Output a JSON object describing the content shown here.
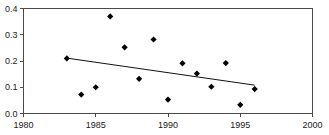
{
  "figure": {
    "top_artifact_text": "· · ·"
  },
  "chart_data": {
    "type": "scatter",
    "title": "",
    "subtitle": "",
    "xlabel": "",
    "ylabel": "",
    "xlim": [
      1980,
      2000
    ],
    "ylim": [
      0.0,
      0.4
    ],
    "xticks": [
      1980,
      1985,
      1990,
      1995,
      2000
    ],
    "xticklabels": [
      "1980",
      "1985",
      "1990",
      "1995",
      "2000"
    ],
    "yticks": [
      0.0,
      0.1,
      0.2,
      0.3,
      0.4
    ],
    "yticklabels": [
      "0.0",
      "0.1",
      "0.2",
      "0.3",
      "0.4"
    ],
    "grid": false,
    "legend": false,
    "marker": "diamond",
    "marker_color": "#000000",
    "x": [
      1983,
      1984,
      1985,
      1986,
      1987,
      1988,
      1989,
      1990,
      1991,
      1992,
      1993,
      1994,
      1995,
      1996
    ],
    "values": [
      0.21,
      0.072,
      0.1,
      0.37,
      0.252,
      0.132,
      0.282,
      0.053,
      0.191,
      0.152,
      0.102,
      0.192,
      0.033,
      0.093
    ],
    "series": [
      {
        "name": "observations",
        "x": [
          1983,
          1984,
          1985,
          1986,
          1987,
          1988,
          1989,
          1990,
          1991,
          1992,
          1993,
          1994,
          1995,
          1996
        ],
        "values": [
          0.21,
          0.072,
          0.1,
          0.37,
          0.252,
          0.132,
          0.282,
          0.053,
          0.191,
          0.152,
          0.102,
          0.192,
          0.033,
          0.093
        ]
      }
    ],
    "trendline": {
      "name": "linear-fit",
      "x": [
        1983,
        1996
      ],
      "values": [
        0.211,
        0.108
      ],
      "color": "#111111"
    },
    "annotations": []
  }
}
